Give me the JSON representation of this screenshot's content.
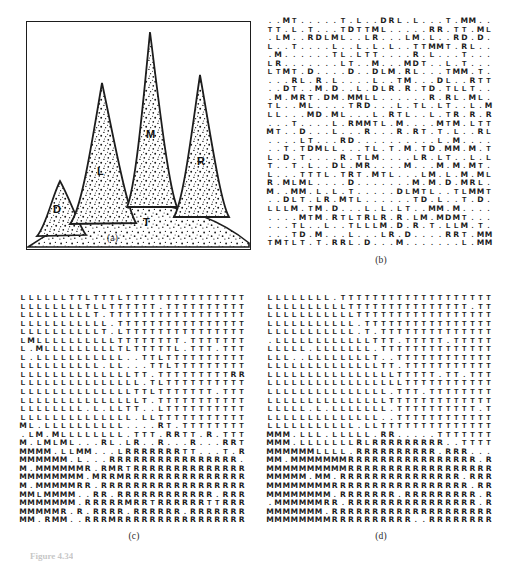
{
  "figure": {
    "caption": "Figure 4.34",
    "panels": [
      {
        "id": "a",
        "caption": "(a)",
        "kind": "terrain-drawing"
      },
      {
        "id": "b",
        "caption": "(b)",
        "kind": "character-grid"
      },
      {
        "id": "c",
        "caption": "(c)",
        "kind": "character-grid"
      },
      {
        "id": "d",
        "caption": "(d)",
        "kind": "character-grid"
      }
    ]
  },
  "panel_a": {
    "labels": [
      {
        "text": "D",
        "x": 27,
        "y": 188
      },
      {
        "text": "L",
        "x": 72,
        "y": 150
      },
      {
        "text": "M",
        "x": 121,
        "y": 113
      },
      {
        "text": "R",
        "x": 172,
        "y": 140
      },
      {
        "text": "T",
        "x": 117,
        "y": 197
      }
    ],
    "legend_meaning": {
      "D": "small left peak",
      "L": "left tall peak",
      "M": "tallest middle peak",
      "R": "right peak",
      "T": "terrain base"
    }
  },
  "chart_data": {
    "type": "heatmap",
    "title": "Figure 4.34",
    "symbols": [
      "D",
      "L",
      "M",
      "R",
      "T",
      "."
    ],
    "grid_size": {
      "cols": 28,
      "rows": 27
    },
    "panel_b": {
      "caption": "(b)",
      "description": "initial unlabeled / random symbol assignment",
      "rows": [
        "ML..L..TTTLL..L..LM.LMT.......M",
        ".T.LMM..M.M.MMM.T.M.M...M..MML.",
        "....MTT..M.M..TMM..L...MMT...M.",
        "...MLL.......M..LM.T.TL.T.T.MTM",
        ".MT.TM.....T.MML.L..M.L.M...ML.",
        "T.LLM..T.M...L.....T.TM...LT.M.",
        ".....T..MM...T.T.T..MM.T.MM...."
      ]
    },
    "panel_c": {
      "caption": "(c)",
      "description": "partially converged region labeling",
      "regions": [
        "M",
        "L",
        "T",
        "R"
      ]
    },
    "panel_d": {
      "caption": "(d)",
      "description": "final converged region labeling",
      "regions": [
        "R",
        "T",
        "L",
        "M"
      ]
    }
  }
}
